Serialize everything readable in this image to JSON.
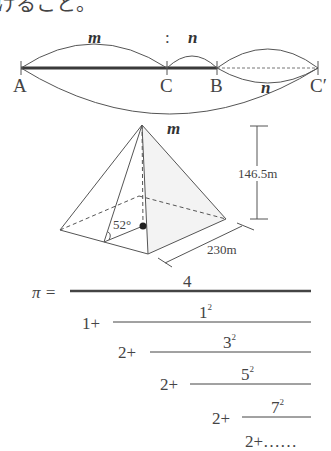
{
  "header_text": "けること。",
  "ratio_diagram": {
    "label_m": "m",
    "label_colon": ":",
    "label_n": "n",
    "label_n_lower": "n",
    "points": [
      {
        "name": "A",
        "x": 21
      },
      {
        "name": "C",
        "x": 167
      },
      {
        "name": "B",
        "x": 217
      },
      {
        "name": "C′",
        "x": 318
      }
    ]
  },
  "pyramid": {
    "apex_label": "m",
    "angle_label": "52°",
    "height_label": "146.5m",
    "base_label": "230m"
  },
  "formula": {
    "lhs": "π =",
    "numerator": "4",
    "terms": [
      {
        "lead": "1+",
        "num": "1",
        "exp": "2"
      },
      {
        "lead": "2+",
        "num": "3",
        "exp": "2"
      },
      {
        "lead": "2+",
        "num": "5",
        "exp": "2"
      },
      {
        "lead": "2+",
        "num": "7",
        "exp": "2"
      }
    ],
    "tail": "2+……"
  }
}
